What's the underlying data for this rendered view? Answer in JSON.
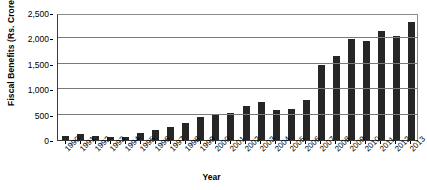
{
  "chart_data": {
    "type": "bar",
    "title": "",
    "xlabel": "Year",
    "ylabel": "Fiscal Benefits (Rs. Crores)",
    "ylim": [
      0,
      2500
    ],
    "ytick_values": [
      0,
      500,
      1000,
      1500,
      2000,
      2500
    ],
    "ytick_labels": [
      "0",
      "500",
      "1,000",
      "1,500",
      "2,000",
      "2,500"
    ],
    "grid": true,
    "legend": "none",
    "bar_color": "#262626",
    "categories": [
      "1990",
      "1991",
      "1992",
      "1993",
      "1994",
      "1995",
      "1996",
      "1997",
      "1998",
      "1999",
      "2000",
      "2001",
      "2002",
      "2003",
      "2004",
      "2005",
      "2006",
      "2007",
      "2008",
      "2009",
      "2010",
      "2011",
      "2012",
      "2013"
    ],
    "values": [
      75,
      125,
      80,
      65,
      55,
      145,
      205,
      255,
      340,
      460,
      500,
      535,
      665,
      745,
      600,
      620,
      790,
      1470,
      1655,
      1980,
      1940,
      2140,
      2055,
      2330
    ]
  }
}
